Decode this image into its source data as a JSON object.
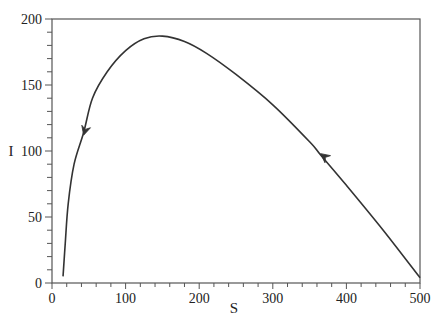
{
  "chart_data": {
    "type": "line",
    "title": "",
    "xlabel": "S",
    "ylabel": "I",
    "xlim": [
      0,
      500
    ],
    "ylim": [
      0,
      200
    ],
    "grid": false,
    "legend": null,
    "x_ticks": [
      0,
      100,
      200,
      300,
      400,
      500
    ],
    "y_ticks": [
      0,
      50,
      100,
      150,
      200
    ],
    "x_tick_labels": [
      "0",
      "100",
      "200",
      "300",
      "400",
      "500"
    ],
    "y_tick_labels": [
      "0",
      "50",
      "100",
      "150",
      "200"
    ],
    "series": [
      {
        "name": "trajectory",
        "color": "#333333",
        "x": [
          15,
          18,
          22,
          30,
          43,
          55,
          75,
          100,
          125,
          150,
          180,
          210,
          250,
          300,
          350,
          365,
          400,
          450,
          500
        ],
        "y": [
          5,
          30,
          60,
          90,
          114,
          140,
          160,
          176,
          185,
          187,
          183,
          174,
          158,
          135,
          107,
          97,
          74,
          40,
          4
        ]
      }
    ],
    "annotations": [
      {
        "type": "arrow",
        "x": 43,
        "y": 114,
        "direction": "down-left"
      },
      {
        "type": "arrow",
        "x": 365,
        "y": 97,
        "direction": "up-left"
      }
    ]
  },
  "labels": {
    "xlabel": "S",
    "ylabel": "I"
  }
}
